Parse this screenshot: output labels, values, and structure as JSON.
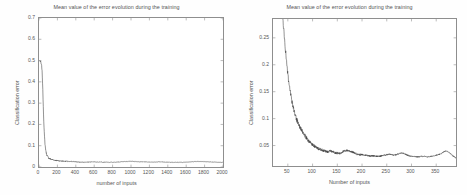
{
  "figure_left": {
    "title": "Mean value of the error evolution during the training",
    "xlabel": "number of inputs",
    "ylabel": "Classification error",
    "xticks": [
      "0",
      "200",
      "400",
      "600",
      "800",
      "1000",
      "1200",
      "1400",
      "1600",
      "1800",
      "2000"
    ],
    "yticks": [
      "0",
      "0.1",
      "0.2",
      "0.3",
      "0.4",
      "0.5",
      "0.6",
      "0.7"
    ]
  },
  "figure_right": {
    "title": "Mean value of the error evolution during the training",
    "xlabel": "Number of inputs",
    "ylabel": "Classification error",
    "xticks": [
      "50",
      "100",
      "150",
      "200",
      "250",
      "300",
      "350"
    ],
    "yticks": [
      "0.05",
      "0.1",
      "0.15",
      "0.2",
      "0.25"
    ]
  },
  "colors": {
    "line": "#3a3a3a",
    "axis": "#8e8e8e",
    "text": "#555555",
    "background": "#ffffff"
  },
  "chart_data": [
    {
      "type": "line",
      "id": "left-full-range",
      "title": "Mean value of the error evolution during the training",
      "xlabel": "number of inputs",
      "ylabel": "Classification error",
      "xlim": [
        0,
        2000
      ],
      "ylim": [
        0,
        0.7
      ],
      "xticks": [
        0,
        200,
        400,
        600,
        800,
        1000,
        1200,
        1400,
        1600,
        1800,
        2000
      ],
      "yticks": [
        0,
        0.1,
        0.2,
        0.3,
        0.4,
        0.5,
        0.6,
        0.7
      ],
      "grid": false,
      "legend": null,
      "series": [
        {
          "name": "Classification error",
          "x": [
            10,
            20,
            30,
            35,
            40,
            45,
            50,
            55,
            60,
            65,
            70,
            75,
            80,
            85,
            90,
            95,
            100,
            110,
            120,
            130,
            140,
            150,
            160,
            170,
            180,
            190,
            200,
            220,
            240,
            260,
            280,
            300,
            320,
            340,
            360,
            380,
            400,
            440,
            480,
            520,
            560,
            600,
            640,
            680,
            720,
            760,
            800,
            840,
            880,
            920,
            960,
            1000,
            1040,
            1080,
            1120,
            1160,
            1200,
            1240,
            1280,
            1320,
            1360,
            1400,
            1440,
            1480,
            1520,
            1560,
            1600,
            1640,
            1680,
            1720,
            1760,
            1800,
            1840,
            1880,
            1920,
            1960,
            2000
          ],
          "y": [
            0.5,
            0.49,
            0.47,
            0.44,
            0.38,
            0.31,
            0.24,
            0.18,
            0.14,
            0.11,
            0.09,
            0.075,
            0.065,
            0.058,
            0.052,
            0.048,
            0.045,
            0.041,
            0.038,
            0.036,
            0.035,
            0.034,
            0.033,
            0.032,
            0.031,
            0.031,
            0.03,
            0.029,
            0.028,
            0.028,
            0.027,
            0.027,
            0.026,
            0.026,
            0.026,
            0.025,
            0.024,
            0.023,
            0.023,
            0.023,
            0.024,
            0.024,
            0.023,
            0.023,
            0.023,
            0.022,
            0.022,
            0.023,
            0.024,
            0.025,
            0.026,
            0.027,
            0.026,
            0.025,
            0.024,
            0.024,
            0.023,
            0.023,
            0.024,
            0.024,
            0.023,
            0.023,
            0.022,
            0.022,
            0.022,
            0.022,
            0.023,
            0.024,
            0.025,
            0.026,
            0.026,
            0.025,
            0.024,
            0.023,
            0.023,
            0.022,
            0.022
          ]
        }
      ]
    },
    {
      "type": "line",
      "id": "right-zoomed-range",
      "title": "Mean value of the error evolution during the training",
      "xlabel": "Number of inputs",
      "ylabel": "Classification error",
      "xlim": [
        20,
        390
      ],
      "ylim": [
        0.012,
        0.285
      ],
      "xticks": [
        50,
        100,
        150,
        200,
        250,
        300,
        350
      ],
      "yticks": [
        0.05,
        0.1,
        0.15,
        0.2,
        0.25
      ],
      "grid": false,
      "legend": null,
      "series": [
        {
          "name": "Classification error",
          "x": [
            40,
            44,
            48,
            52,
            55,
            58,
            60,
            63,
            66,
            69,
            72,
            75,
            78,
            81,
            84,
            87,
            90,
            93,
            96,
            99,
            102,
            105,
            108,
            112,
            116,
            120,
            124,
            128,
            132,
            136,
            140,
            145,
            150,
            155,
            160,
            165,
            170,
            175,
            180,
            185,
            190,
            195,
            200,
            205,
            210,
            215,
            220,
            225,
            230,
            235,
            240,
            245,
            250,
            255,
            260,
            265,
            270,
            275,
            280,
            285,
            290,
            295,
            300,
            305,
            310,
            315,
            320,
            325,
            330,
            335,
            340,
            345,
            350,
            355,
            360,
            365,
            370,
            375,
            380,
            385,
            390
          ],
          "y": [
            0.285,
            0.24,
            0.2,
            0.165,
            0.15,
            0.132,
            0.125,
            0.113,
            0.104,
            0.096,
            0.089,
            0.083,
            0.078,
            0.073,
            0.069,
            0.065,
            0.061,
            0.058,
            0.055,
            0.052,
            0.05,
            0.048,
            0.046,
            0.044,
            0.043,
            0.042,
            0.04,
            0.039,
            0.038,
            0.04,
            0.039,
            0.037,
            0.036,
            0.035,
            0.038,
            0.04,
            0.041,
            0.04,
            0.038,
            0.036,
            0.034,
            0.033,
            0.033,
            0.032,
            0.032,
            0.031,
            0.031,
            0.031,
            0.03,
            0.03,
            0.031,
            0.032,
            0.033,
            0.034,
            0.033,
            0.032,
            0.033,
            0.035,
            0.036,
            0.035,
            0.033,
            0.031,
            0.03,
            0.03,
            0.029,
            0.029,
            0.03,
            0.03,
            0.029,
            0.029,
            0.03,
            0.031,
            0.032,
            0.033,
            0.035,
            0.038,
            0.04,
            0.038,
            0.034,
            0.03,
            0.027
          ]
        }
      ]
    }
  ]
}
